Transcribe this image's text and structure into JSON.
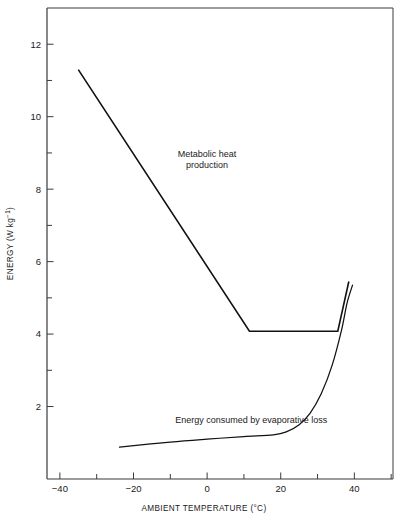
{
  "chart_data": {
    "type": "line",
    "title": "",
    "xlabel": "AMBIENT TEMPERATURE (°C)",
    "ylabel": "ENERGY (W kg⁻¹)",
    "ylabel_main": "ENERGY (W kg",
    "ylabel_sup": "−1",
    "ylabel_tail": ")",
    "xlim": [
      -43.5,
      50.5
    ],
    "ylim": [
      0,
      13.0
    ],
    "grid": false,
    "legend": "none",
    "xticks": [
      -40,
      -30,
      -20,
      -10,
      0,
      10,
      20,
      30,
      40,
      50
    ],
    "xtick_labels": [
      "−40",
      "",
      "−20",
      "",
      "0",
      "",
      "20",
      "",
      "40",
      ""
    ],
    "yticks": [
      2,
      3,
      4,
      5,
      6,
      7,
      8,
      9,
      10,
      11,
      12
    ],
    "ytick_labels": [
      "2",
      "",
      "4",
      "",
      "6",
      "",
      "8",
      "",
      "10",
      "",
      "12"
    ],
    "annotations": [
      {
        "name": "metabolic-heat-label",
        "text_line1": "Metabolic heat",
        "text_line2": "production",
        "x": 0.0,
        "y": 8.9
      },
      {
        "name": "evaporative-loss-label",
        "text": "Energy consumed by evaporative loss",
        "x": 12.0,
        "y": 1.55
      }
    ],
    "series": [
      {
        "name": "Metabolic heat production",
        "type": "line",
        "points": [
          [
            -35.0,
            11.3
          ],
          [
            11.5,
            4.08
          ],
          [
            35.5,
            4.08
          ],
          [
            38.5,
            5.45
          ]
        ]
      },
      {
        "name": "Energy consumed by evaporative loss",
        "type": "curve",
        "points": [
          [
            -23.8,
            0.88
          ],
          [
            -10.0,
            1.02
          ],
          [
            0.0,
            1.1
          ],
          [
            10.0,
            1.17
          ],
          [
            18.0,
            1.22
          ],
          [
            21.5,
            1.3
          ],
          [
            25.0,
            1.5
          ],
          [
            28.0,
            1.82
          ],
          [
            31.0,
            2.35
          ],
          [
            34.0,
            3.15
          ],
          [
            36.5,
            4.1
          ],
          [
            38.0,
            4.85
          ],
          [
            39.5,
            5.35
          ]
        ]
      }
    ]
  }
}
